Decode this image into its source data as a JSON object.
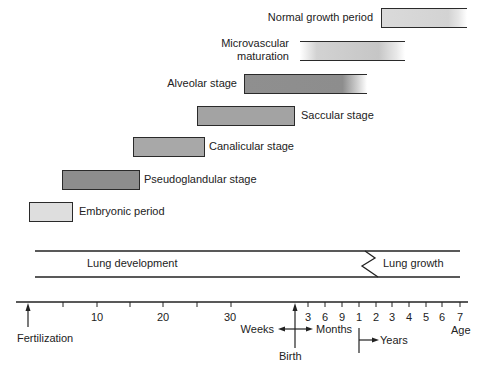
{
  "stages": [
    {
      "label": "Normal growth period",
      "fill": "#d6d6d6"
    },
    {
      "label_line1": "Microvascular",
      "label_line2": "maturation",
      "fill": "#c8c8c8"
    },
    {
      "label": "Alveolar stage",
      "fill": "#8f8f8f"
    },
    {
      "label": "Saccular stage",
      "fill": "#a3a3a3"
    },
    {
      "label": "Canalicular stage",
      "fill": "#a8a8a8"
    },
    {
      "label": "Pseudoglandular stage",
      "fill": "#8d8d8d"
    },
    {
      "label": "Embryonic period",
      "fill": "#dedede"
    }
  ],
  "band": {
    "development_label": "Lung development",
    "growth_label": "Lung growth"
  },
  "axis": {
    "week_labels": [
      "10",
      "20",
      "30"
    ],
    "month_labels": [
      "3",
      "6",
      "9"
    ],
    "year_labels": [
      "1",
      "2",
      "3",
      "4",
      "5",
      "6",
      "7"
    ],
    "age_label": "Age",
    "fertilization_label": "Fertilization",
    "birth_label": "Birth",
    "weeks_label": "Weeks",
    "months_label": "Months",
    "years_label": "Years"
  }
}
